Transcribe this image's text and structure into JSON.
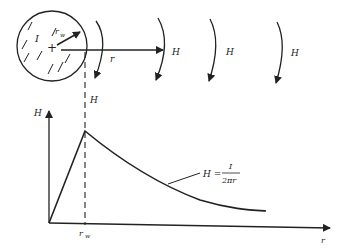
{
  "diagram": {
    "wire": {
      "current_label": "I",
      "radius_label": "r",
      "radius_sub": "w",
      "center_mark": "+"
    },
    "field_labels": [
      "H",
      "H",
      "H",
      "H"
    ],
    "radial_label": "r",
    "graph": {
      "y_axis_label": "H",
      "x_axis_label": "r",
      "x_tick_label": "r",
      "x_tick_sub": "w",
      "formula_lhs": "H =",
      "formula_num": "I",
      "formula_den": "2πr"
    },
    "colors": {
      "ink": "#222222",
      "background": "#ffffff"
    }
  }
}
